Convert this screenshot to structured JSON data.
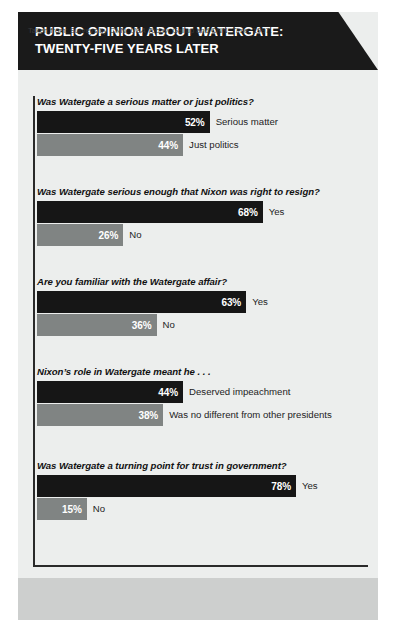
{
  "title": "PUBLIC OPINION ABOUT WATERGATE:\nTWENTY-FIVE YEARS LATER",
  "source": {
    "prefix": "Taken from: Surveys by CNN, ",
    "italic1": "USA Today",
    "middle": ", Gallup and CNN, ",
    "italic2": "Time",
    "suffix": ", 1997."
  },
  "colors": {
    "banner": "#1a1a1a",
    "panel": "#eceeed",
    "bar_dark": "#161616",
    "bar_light": "#808483",
    "footer_band": "#cdcfce"
  },
  "chart_data": {
    "type": "bar",
    "title": "PUBLIC OPINION ABOUT WATERGATE: TWENTY-FIVE YEARS LATER",
    "xlabel": "",
    "ylabel": "",
    "xlim": [
      0,
      100
    ],
    "unit": "%",
    "grid": false,
    "legend": "none",
    "orientation": "horizontal",
    "groups": [
      {
        "question": "Was Watergate a serious matter or just politics?",
        "bars": [
          {
            "label": "Serious matter",
            "value": 52,
            "value_label": "52%",
            "color": "dark"
          },
          {
            "label": "Just politics",
            "value": 44,
            "value_label": "44%",
            "color": "light"
          }
        ]
      },
      {
        "question": "Was Watergate serious enough that Nixon was right to resign?",
        "bars": [
          {
            "label": "Yes",
            "value": 68,
            "value_label": "68%",
            "color": "dark"
          },
          {
            "label": "No",
            "value": 26,
            "value_label": "26%",
            "color": "light"
          }
        ]
      },
      {
        "question": "Are you familiar with the Watergate affair?",
        "bars": [
          {
            "label": "Yes",
            "value": 63,
            "value_label": "63%",
            "color": "dark"
          },
          {
            "label": "No",
            "value": 36,
            "value_label": "36%",
            "color": "light"
          }
        ]
      },
      {
        "question": "Nixon’s role in Watergate meant he . . .",
        "bars": [
          {
            "label": "Deserved impeachment",
            "value": 44,
            "value_label": "44%",
            "color": "dark"
          },
          {
            "label": "Was no different from other presidents",
            "value": 38,
            "value_label": "38%",
            "color": "light"
          }
        ]
      },
      {
        "question": "Was Watergate a turning point for trust in government?",
        "bars": [
          {
            "label": "Yes",
            "value": 78,
            "value_label": "78%",
            "color": "dark"
          },
          {
            "label": "No",
            "value": 15,
            "value_label": "15%",
            "color": "light"
          }
        ]
      }
    ]
  },
  "layout": {
    "group_tops": [
      26,
      116,
      206,
      296,
      390
    ],
    "px_per_percent": 3.32,
    "bar_origin_x": 0
  }
}
